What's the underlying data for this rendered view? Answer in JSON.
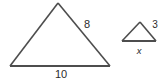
{
  "figure": {
    "background_color": "#ffffff",
    "stroke_color": "#4d4d4d",
    "text_color": "#2b2b2b"
  },
  "large_triangle": {
    "name": "large-triangle",
    "vertices": {
      "apex": [
        58,
        3
      ],
      "bottom_left": [
        10,
        66
      ],
      "bottom_right": [
        110,
        66
      ]
    },
    "labels": {
      "right_side": "8",
      "base": "10"
    }
  },
  "small_triangle": {
    "name": "small-triangle",
    "vertices": {
      "apex": [
        140,
        22
      ],
      "bottom_left": [
        122,
        41
      ],
      "bottom_right": [
        156,
        41
      ]
    },
    "labels": {
      "right_side": "3",
      "base": "x"
    }
  }
}
